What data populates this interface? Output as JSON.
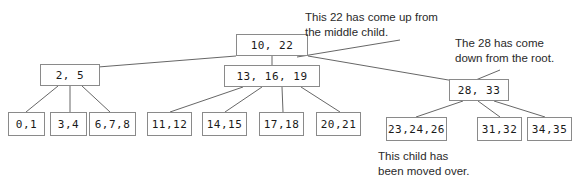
{
  "diagram": {
    "background_color": "#ffffff",
    "node_border_color": "#8a8a8a",
    "edge_color": "#555555",
    "text_color": "#1a1a1a",
    "nodes": {
      "root": "10, 22",
      "internal_left": "2, 5",
      "internal_middle": "13, 16, 19",
      "internal_right": "28, 33",
      "leaf_1": "0,1",
      "leaf_2": "3,4",
      "leaf_3": "6,7,8",
      "leaf_4": "11,12",
      "leaf_5": "14,15",
      "leaf_6": "17,18",
      "leaf_7": "20,21",
      "leaf_8": "23,24,26",
      "leaf_9": "31,32",
      "leaf_10": "34,35"
    },
    "annotations": {
      "up_from_middle_line1": "This 22 has come up from",
      "up_from_middle_line2": "the middle child.",
      "down_from_root_line1": "The 28 has come",
      "down_from_root_line2": "down from the root.",
      "moved_over_line1": "This child has",
      "moved_over_line2": "been moved over."
    }
  }
}
